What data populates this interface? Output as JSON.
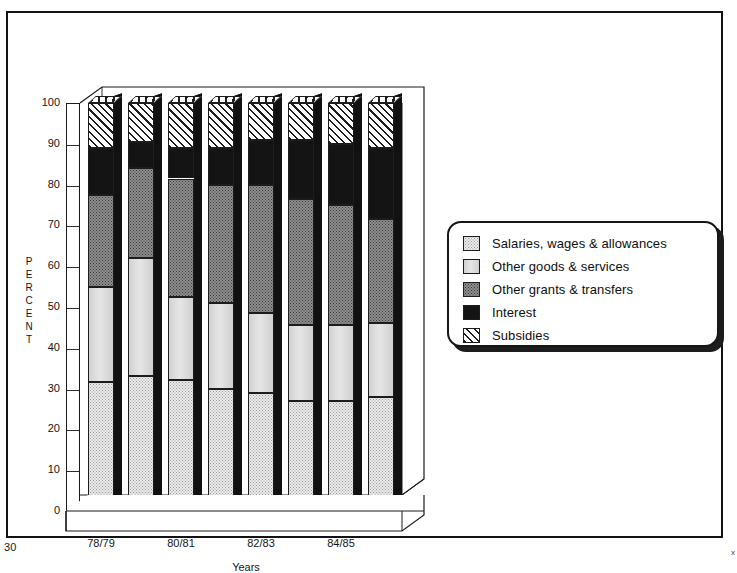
{
  "page": {
    "number": "30",
    "corner_mark": "x"
  },
  "chart_data": {
    "type": "bar",
    "subtype": "stacked-100-percent-3d",
    "title": "",
    "xlabel": "Years",
    "ylabel": "PERCENT",
    "ylim": [
      0,
      100
    ],
    "yticks": [
      0,
      10,
      20,
      30,
      40,
      50,
      60,
      70,
      80,
      90,
      100
    ],
    "ytick_labels": [
      "0",
      "10",
      "20",
      "30",
      "40",
      "50",
      "60",
      "70",
      "80",
      "90",
      "100"
    ],
    "grid": true,
    "legend_position": "right",
    "categories": [
      "78/79",
      "79/80",
      "80/81",
      "81/82",
      "82/83",
      "83/84",
      "84/85",
      "85/86"
    ],
    "xtick_labels_shown": [
      "78/79",
      "80/81",
      "82/83",
      "84/85"
    ],
    "series": [
      {
        "name": "Salaries, wages & allowances",
        "fill": "light-dotted",
        "color": "#ebebeb",
        "values": [
          31.5,
          33.0,
          32.0,
          30.0,
          29.0,
          27.0,
          27.0,
          28.0
        ]
      },
      {
        "name": "Other goods & services",
        "fill": "light-gray",
        "color": "#d9d9d9",
        "values": [
          23.5,
          29.0,
          20.5,
          21.0,
          19.5,
          18.5,
          18.5,
          18.0
        ]
      },
      {
        "name": "Other grants & transfers",
        "fill": "dark-dotted",
        "color": "#8e8e8e",
        "values": [
          22.5,
          22.0,
          29.0,
          29.0,
          31.5,
          31.0,
          29.5,
          25.5
        ]
      },
      {
        "name": "Interest",
        "fill": "solid-black",
        "color": "#141414",
        "values": [
          11.5,
          6.5,
          7.5,
          9.0,
          11.0,
          14.5,
          15.0,
          17.5
        ]
      },
      {
        "name": "Subsidies",
        "fill": "diagonal-hatch",
        "color": "#ffffff",
        "values": [
          11.0,
          9.5,
          11.0,
          11.0,
          9.0,
          9.0,
          10.0,
          11.0
        ]
      }
    ],
    "cumulative_tops": [
      [
        31.5,
        55.0,
        77.5,
        89.0,
        100.0
      ],
      [
        33.0,
        62.0,
        84.0,
        90.5,
        100.0
      ],
      [
        32.0,
        52.5,
        81.5,
        89.0,
        100.0
      ],
      [
        30.0,
        51.0,
        80.0,
        89.0,
        100.0
      ],
      [
        29.0,
        48.5,
        80.0,
        91.0,
        100.0
      ],
      [
        27.0,
        45.5,
        76.5,
        91.0,
        100.0
      ],
      [
        27.0,
        45.5,
        75.0,
        90.0,
        100.0
      ],
      [
        28.0,
        46.0,
        71.5,
        89.0,
        100.0
      ]
    ]
  },
  "legend": {
    "items": [
      {
        "label": "Salaries, wages & allowances",
        "swatch": "light-dotted"
      },
      {
        "label": "Other goods & services",
        "swatch": "light-gray"
      },
      {
        "label": "Other grants & transfers",
        "swatch": "dark-dotted"
      },
      {
        "label": "Interest",
        "swatch": "solid-black"
      },
      {
        "label": "Subsidies",
        "swatch": "diagonal-hatch"
      }
    ]
  }
}
